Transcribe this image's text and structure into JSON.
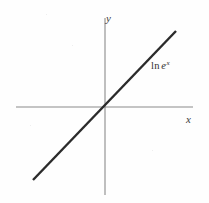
{
  "figure": {
    "background_color": "#fefefe",
    "width": 209,
    "height": 203
  },
  "axes": {
    "color": "#8a8a8a",
    "stroke_width": 1.1,
    "origin": {
      "x": 105,
      "y": 107
    },
    "x_axis": {
      "x_start": 16,
      "x_end": 193,
      "y": 107
    },
    "y_axis": {
      "y_start": 18,
      "y_end": 195,
      "x": 105
    },
    "x_label": "x",
    "y_label": "y"
  },
  "curve": {
    "label_prefix": "ln",
    "label_base": "e",
    "label_exponent": "x",
    "color": "#2b2b2b",
    "stroke_width": 2.4,
    "start": {
      "x": 33,
      "y": 180
    },
    "end": {
      "x": 176,
      "y": 31
    }
  },
  "chart_data": {
    "type": "line",
    "title": "",
    "subtitle": "",
    "xlabel": "x",
    "ylabel": "y",
    "grid": false,
    "legend_position": "inline-right",
    "annotations": [
      "ln e^x"
    ],
    "axis_style": "cartesian-cross-through-origin",
    "xlim": [
      -5.0,
      5.0
    ],
    "ylim": [
      -5.0,
      5.0
    ],
    "series": [
      {
        "name": "ln e^x",
        "formula": "y = ln(e^x) = x",
        "slope": 1,
        "intercept": 0,
        "x": [
          -4.1,
          -3.0,
          -2.0,
          -1.0,
          0.0,
          1.0,
          2.0,
          3.0,
          4.1
        ],
        "values": [
          -4.1,
          -3.0,
          -2.0,
          -1.0,
          0.0,
          1.0,
          2.0,
          3.0,
          4.1
        ]
      }
    ]
  }
}
